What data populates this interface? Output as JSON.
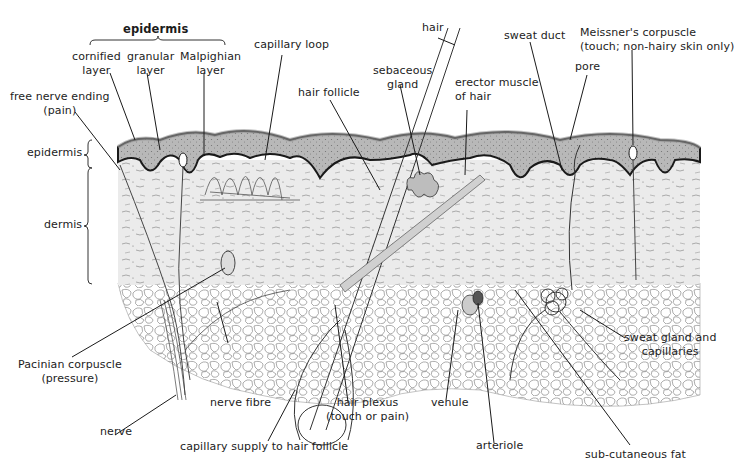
{
  "diagram": {
    "colors": {
      "background": "#ffffff",
      "dermis_fill": "#e9e9e9",
      "epidermis_fill": "#bdbdbd",
      "cornified_fill": "#dcdcdc",
      "basement_line": "#1a1a1a",
      "fat_cell_stroke": "#8a8a8a",
      "ink": "#1c1c1c"
    },
    "header": {
      "epidermis_group_label": "epidermis"
    },
    "layer_brackets": {
      "epidermis": "epidermis",
      "dermis": "dermis"
    },
    "labels": {
      "cornified_layer": [
        "cornified",
        "layer"
      ],
      "granular_layer": [
        "granular",
        "layer"
      ],
      "malpighian_layer": [
        "Malpighian",
        "layer"
      ],
      "free_nerve_ending": [
        "free nerve ending",
        "(pain)"
      ],
      "capillary_loop": "capillary loop",
      "hair": "hair",
      "hair_follicle": "hair follicle",
      "sebaceous_gland": [
        "sebaceous",
        "gland"
      ],
      "erector_muscle": [
        "erector muscle",
        "of hair"
      ],
      "sweat_duct": "sweat duct",
      "pore": "pore",
      "meissners_corpuscle": [
        "Meissner's corpuscle",
        "(touch; non-hairy skin only)"
      ],
      "pacinian_corpuscle": [
        "Pacinian corpuscle",
        "(pressure)"
      ],
      "nerve_fibre": "nerve fibre",
      "nerve": "nerve",
      "capillary_supply": "capillary supply to hair follicle",
      "hair_plexus": [
        "hair plexus",
        "(touch or pain)"
      ],
      "venule": "venule",
      "arteriole": "arteriole",
      "sub_cutaneous_fat": "sub-cutaneous fat",
      "sweat_gland": [
        "sweat gland and",
        "capillaries"
      ]
    }
  }
}
